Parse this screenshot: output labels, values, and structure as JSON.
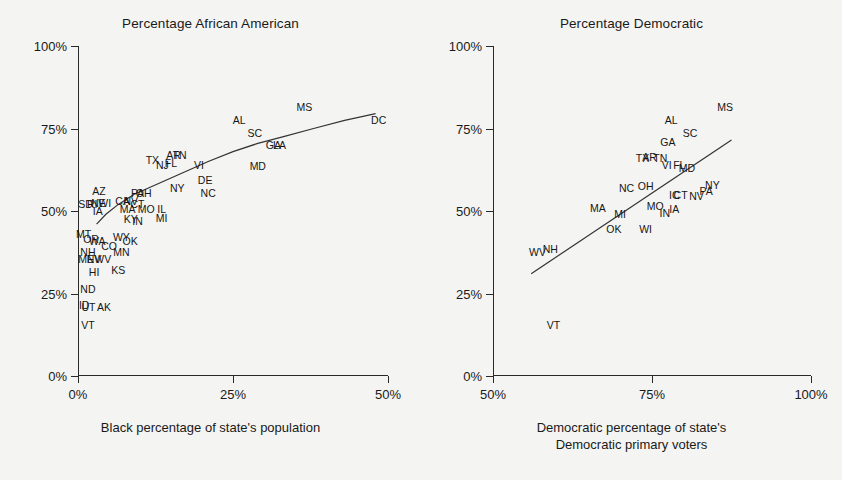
{
  "chart_data": [
    {
      "type": "scatter",
      "panel": "left",
      "title": "Percentage African American",
      "xlabel": "Black percentage of state's population",
      "xlabel_lines": [
        "Black percentage of state's population"
      ],
      "ylabel": "",
      "xlim": [
        0,
        50
      ],
      "ylim": [
        0,
        100
      ],
      "xticks": [
        0,
        25,
        50
      ],
      "xticklabels": [
        "0%",
        "25%",
        "50%"
      ],
      "yticks": [
        0,
        25,
        50,
        75,
        100
      ],
      "yticklabels": [
        "0%",
        "25%",
        "50%",
        "75%",
        "100%"
      ],
      "grid": false,
      "legend": "none",
      "point_marker": "text-label",
      "fit": {
        "type": "smooth-curve",
        "note": "logarithmic-like trend line"
      },
      "fit_points": [
        [
          3.0,
          46.0
        ],
        [
          4.5,
          49.0
        ],
        [
          6.5,
          52.0
        ],
        [
          9.0,
          55.0
        ],
        [
          12.0,
          57.5
        ],
        [
          15.0,
          60.0
        ],
        [
          18.0,
          62.5
        ],
        [
          21.0,
          65.0
        ],
        [
          25.0,
          68.0
        ],
        [
          29.0,
          70.5
        ],
        [
          33.0,
          72.5
        ],
        [
          38.0,
          75.0
        ],
        [
          43.0,
          77.5
        ],
        [
          48.0,
          79.5
        ]
      ],
      "points": [
        {
          "label": "DC",
          "x": 48.5,
          "y": 77.5
        },
        {
          "label": "MS",
          "x": 36.5,
          "y": 81.5
        },
        {
          "label": "AL",
          "x": 26.0,
          "y": 77.5
        },
        {
          "label": "SC",
          "x": 28.5,
          "y": 73.5
        },
        {
          "label": "GA",
          "x": 31.5,
          "y": 70.0
        },
        {
          "label": "LA",
          "x": 32.5,
          "y": 70.0
        },
        {
          "label": "MD",
          "x": 29.0,
          "y": 63.5
        },
        {
          "label": "VI",
          "x": 19.5,
          "y": 64.0
        },
        {
          "label": "DE",
          "x": 20.5,
          "y": 59.5
        },
        {
          "label": "NC",
          "x": 21.0,
          "y": 55.5
        },
        {
          "label": "TX",
          "x": 12.0,
          "y": 65.5
        },
        {
          "label": "AR",
          "x": 15.4,
          "y": 67.0
        },
        {
          "label": "TN",
          "x": 16.4,
          "y": 67.0
        },
        {
          "label": "FL",
          "x": 15.0,
          "y": 64.5
        },
        {
          "label": "NJ",
          "x": 13.6,
          "y": 64.0
        },
        {
          "label": "NY",
          "x": 16.0,
          "y": 57.0
        },
        {
          "label": "PA",
          "x": 9.6,
          "y": 55.5
        },
        {
          "label": "OH",
          "x": 10.6,
          "y": 55.5
        },
        {
          "label": "AZ",
          "x": 3.4,
          "y": 56.0
        },
        {
          "label": "CA",
          "x": 7.2,
          "y": 53.0
        },
        {
          "label": "NV",
          "x": 8.5,
          "y": 53.0
        },
        {
          "label": "CT",
          "x": 9.6,
          "y": 52.0
        },
        {
          "label": "MA",
          "x": 8.0,
          "y": 50.5
        },
        {
          "label": "MO",
          "x": 11.0,
          "y": 50.5
        },
        {
          "label": "IL",
          "x": 13.5,
          "y": 50.5
        },
        {
          "label": "MI",
          "x": 13.5,
          "y": 48.0
        },
        {
          "label": "KY",
          "x": 8.5,
          "y": 47.5
        },
        {
          "label": "IN",
          "x": 9.6,
          "y": 47.0
        },
        {
          "label": "SD",
          "x": 1.2,
          "y": 52.0
        },
        {
          "label": "RI",
          "x": 2.3,
          "y": 52.0
        },
        {
          "label": "NE",
          "x": 3.3,
          "y": 52.5
        },
        {
          "label": "WI",
          "x": 4.3,
          "y": 52.5
        },
        {
          "label": "IA",
          "x": 3.2,
          "y": 50.0
        },
        {
          "label": "MT",
          "x": 0.9,
          "y": 43.0
        },
        {
          "label": "OR",
          "x": 2.1,
          "y": 41.5
        },
        {
          "label": "WA",
          "x": 3.1,
          "y": 41.0
        },
        {
          "label": "WY",
          "x": 7.0,
          "y": 42.0
        },
        {
          "label": "OK",
          "x": 8.4,
          "y": 41.0
        },
        {
          "label": "CO",
          "x": 5.0,
          "y": 39.5
        },
        {
          "label": "NH",
          "x": 1.6,
          "y": 37.5
        },
        {
          "label": "MN",
          "x": 7.0,
          "y": 37.5
        },
        {
          "label": "ME",
          "x": 1.3,
          "y": 35.5
        },
        {
          "label": "NV",
          "x": 2.6,
          "y": 35.5
        },
        {
          "label": "WV",
          "x": 4.0,
          "y": 35.5
        },
        {
          "label": "HI",
          "x": 2.6,
          "y": 31.5
        },
        {
          "label": "KS",
          "x": 6.5,
          "y": 32.0
        },
        {
          "label": "ND",
          "x": 1.6,
          "y": 26.5
        },
        {
          "label": "ID",
          "x": 1.0,
          "y": 21.5
        },
        {
          "label": "UT",
          "x": 1.7,
          "y": 21.0
        },
        {
          "label": "AK",
          "x": 4.2,
          "y": 21.0
        },
        {
          "label": "VT",
          "x": 1.6,
          "y": 15.5
        }
      ]
    },
    {
      "type": "scatter",
      "panel": "right",
      "title": "Percentage Democratic",
      "xlabel": "Democratic percentage of state's Democratic primary voters",
      "xlabel_lines": [
        "Democratic percentage of state's",
        "Democratic primary voters"
      ],
      "ylabel": "",
      "xlim": [
        50,
        100
      ],
      "ylim": [
        0,
        100
      ],
      "xticks": [
        50,
        75,
        100
      ],
      "xticklabels": [
        "50%",
        "75%",
        "100%"
      ],
      "yticks": [
        0,
        25,
        50,
        75,
        100
      ],
      "yticklabels": [
        "0%",
        "25%",
        "50%",
        "75%",
        "100%"
      ],
      "grid": false,
      "legend": "none",
      "point_marker": "text-label",
      "fit": {
        "type": "line",
        "note": "straight regression line"
      },
      "fit_points": [
        [
          56.0,
          31.0
        ],
        [
          87.5,
          71.5
        ]
      ],
      "points": [
        {
          "label": "MS",
          "x": 86.5,
          "y": 81.5
        },
        {
          "label": "AL",
          "x": 78.0,
          "y": 77.5
        },
        {
          "label": "SC",
          "x": 81.0,
          "y": 73.5
        },
        {
          "label": "GA",
          "x": 77.5,
          "y": 71.0
        },
        {
          "label": "TX",
          "x": 73.5,
          "y": 66.0
        },
        {
          "label": "AR",
          "x": 74.6,
          "y": 66.5
        },
        {
          "label": "TN",
          "x": 76.3,
          "y": 66.0
        },
        {
          "label": "VI",
          "x": 77.3,
          "y": 64.0
        },
        {
          "label": "FL",
          "x": 79.3,
          "y": 64.0
        },
        {
          "label": "MD",
          "x": 80.5,
          "y": 63.0
        },
        {
          "label": "NC",
          "x": 71.0,
          "y": 57.0
        },
        {
          "label": "OH",
          "x": 74.0,
          "y": 57.5
        },
        {
          "label": "NY",
          "x": 84.5,
          "y": 58.0
        },
        {
          "label": "PA",
          "x": 83.5,
          "y": 56.0
        },
        {
          "label": "NV",
          "x": 82.0,
          "y": 54.5
        },
        {
          "label": "CT",
          "x": 79.5,
          "y": 55.0
        },
        {
          "label": "IC",
          "x": 78.5,
          "y": 55.0
        },
        {
          "label": "MO",
          "x": 75.5,
          "y": 51.5
        },
        {
          "label": "IN",
          "x": 77.0,
          "y": 49.5
        },
        {
          "label": "IA",
          "x": 78.5,
          "y": 50.5
        },
        {
          "label": "MA",
          "x": 66.5,
          "y": 51.0
        },
        {
          "label": "MI",
          "x": 70.0,
          "y": 49.0
        },
        {
          "label": "OK",
          "x": 69.0,
          "y": 44.5
        },
        {
          "label": "WI",
          "x": 74.0,
          "y": 44.5
        },
        {
          "label": "WV",
          "x": 57.0,
          "y": 37.5
        },
        {
          "label": "NH",
          "x": 59.0,
          "y": 38.5
        },
        {
          "label": "VT",
          "x": 59.5,
          "y": 15.5
        }
      ]
    }
  ]
}
